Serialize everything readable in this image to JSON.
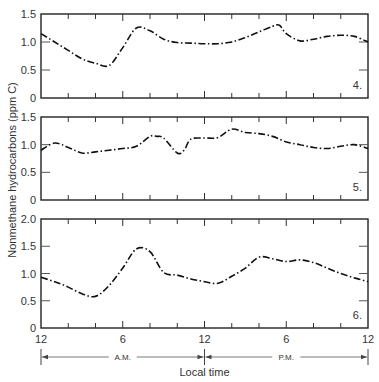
{
  "chart_data": [
    {
      "type": "line",
      "panel_label": "4.",
      "x_hours": [
        0,
        1,
        2,
        3,
        4,
        5,
        6,
        7,
        8,
        9,
        10,
        11,
        12,
        13,
        14,
        15,
        16,
        17,
        17.5,
        18,
        19,
        20,
        21,
        22,
        23,
        24
      ],
      "values": [
        1.15,
        1.0,
        0.85,
        0.7,
        0.62,
        0.58,
        0.9,
        1.25,
        1.2,
        1.05,
        0.99,
        0.98,
        0.97,
        0.97,
        1.0,
        1.08,
        1.18,
        1.28,
        1.3,
        1.15,
        1.02,
        1.05,
        1.1,
        1.12,
        1.1,
        1.0
      ],
      "ylim": [
        0,
        1.5
      ],
      "yticks": [
        "0",
        "0.5",
        "1.0",
        "1.5"
      ]
    },
    {
      "type": "line",
      "panel_label": "5.",
      "x_hours": [
        0,
        1,
        2,
        3,
        4,
        5,
        6,
        7,
        8,
        8.5,
        9,
        10,
        10.5,
        11,
        12,
        13,
        14,
        15,
        16,
        17,
        18,
        19,
        20,
        21,
        22,
        23,
        24
      ],
      "values": [
        0.9,
        1.03,
        0.95,
        0.85,
        0.87,
        0.9,
        0.93,
        0.97,
        1.15,
        1.15,
        1.12,
        0.85,
        0.9,
        1.1,
        1.12,
        1.13,
        1.28,
        1.22,
        1.2,
        1.15,
        1.05,
        1.0,
        0.95,
        0.93,
        0.97,
        1.0,
        0.93
      ],
      "ylim": [
        0,
        1.5
      ],
      "yticks": [
        "0",
        "0.5",
        "1.0",
        "1.5"
      ]
    },
    {
      "type": "line",
      "panel_label": "6.",
      "x_hours": [
        0,
        1,
        2,
        3,
        4,
        5,
        6,
        7,
        8,
        9,
        10,
        11,
        12,
        13,
        14,
        15,
        16,
        17,
        18,
        19,
        20,
        21,
        22,
        23,
        24
      ],
      "values": [
        0.93,
        0.85,
        0.75,
        0.63,
        0.58,
        0.78,
        1.1,
        1.45,
        1.4,
        1.02,
        0.97,
        0.9,
        0.85,
        0.82,
        0.95,
        1.1,
        1.3,
        1.27,
        1.22,
        1.25,
        1.2,
        1.1,
        1.0,
        0.92,
        0.85
      ],
      "ylim": [
        0,
        2.0
      ],
      "yticks": [
        "0",
        "0.5",
        "1.0",
        "1.5",
        "2.0"
      ]
    }
  ],
  "labels": {
    "ylabel": "Nonmethane hydrocarbons (ppm C)",
    "xlabel": "Local time",
    "xticks": [
      "12",
      "6",
      "12",
      "6",
      "12"
    ],
    "am": "A.M.",
    "pm": "P.M."
  }
}
